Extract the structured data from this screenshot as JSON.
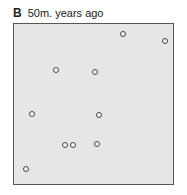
{
  "title": {
    "letter": "B",
    "text": "50m. years ago"
  },
  "panel": {
    "fill": "#e6e6e6",
    "border": "#555555"
  },
  "points": [
    {
      "x": 123,
      "y": 34
    },
    {
      "x": 165,
      "y": 41
    },
    {
      "x": 56,
      "y": 70
    },
    {
      "x": 95,
      "y": 72
    },
    {
      "x": 32,
      "y": 114
    },
    {
      "x": 99,
      "y": 115
    },
    {
      "x": 65,
      "y": 145
    },
    {
      "x": 73,
      "y": 145
    },
    {
      "x": 97,
      "y": 144
    },
    {
      "x": 26,
      "y": 169
    }
  ]
}
